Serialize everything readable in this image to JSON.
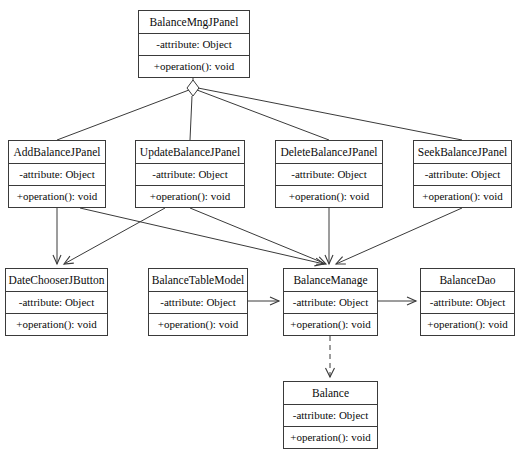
{
  "diagram": {
    "kind": "uml-class-diagram",
    "stroke_color": "#3a3a3a",
    "text_color": "#0b0b0b",
    "background_color": "#ffffff",
    "classes": [
      {
        "id": "balance-mng-jpanel",
        "name": "BalanceMngJPanel",
        "attribute": "-attribute: Object",
        "operation": "+operation(): void",
        "x": 138,
        "y": 10,
        "width": 112,
        "height": 68
      },
      {
        "id": "add-balance-jpanel",
        "name": "AddBalanceJPanel",
        "attribute": "-attribute: Object",
        "operation": "+operation(): void",
        "x": 8,
        "y": 140,
        "width": 98,
        "height": 68
      },
      {
        "id": "update-balance-jpanel",
        "name": "UpdateBalanceJPanel",
        "attribute": "-attribute: Object",
        "operation": "+operation(): void",
        "x": 135,
        "y": 140,
        "width": 110,
        "height": 68
      },
      {
        "id": "delete-balance-jpanel",
        "name": "DeleteBalanceJPanel",
        "attribute": "-attribute: Object",
        "operation": "+operation(): void",
        "x": 275,
        "y": 140,
        "width": 108,
        "height": 68
      },
      {
        "id": "seek-balance-jpanel",
        "name": "SeekBalanceJPanel",
        "attribute": "-attribute: Object",
        "operation": "+operation(): void",
        "x": 413,
        "y": 140,
        "width": 99,
        "height": 68
      },
      {
        "id": "date-chooser-jbutton",
        "name": "DateChooserJButton",
        "attribute": "-attribute: Object",
        "operation": "+operation(): void",
        "x": 5,
        "y": 268,
        "width": 103,
        "height": 68
      },
      {
        "id": "balance-table-model",
        "name": "BalanceTableModel",
        "attribute": "-attribute: Object",
        "operation": "+operation(): void",
        "x": 148,
        "y": 268,
        "width": 100,
        "height": 68
      },
      {
        "id": "balance-manage",
        "name": "BalanceManage",
        "attribute": "-attribute: Object",
        "operation": "+operation(): void",
        "x": 283,
        "y": 268,
        "width": 95,
        "height": 68
      },
      {
        "id": "balance-dao",
        "name": "BalanceDao",
        "attribute": "-attribute: Object",
        "operation": "+operation(): void",
        "x": 420,
        "y": 268,
        "width": 95,
        "height": 68
      },
      {
        "id": "balance",
        "name": "Balance",
        "attribute": "-attribute: Object",
        "operation": "+operation(): void",
        "x": 283,
        "y": 381,
        "width": 95,
        "height": 68
      }
    ],
    "relationships": [
      {
        "id": "rel-mng-add",
        "type": "aggregation",
        "from": "balance-mng-jpanel",
        "to": "add-balance-jpanel",
        "style": "solid"
      },
      {
        "id": "rel-mng-update",
        "type": "aggregation",
        "from": "balance-mng-jpanel",
        "to": "update-balance-jpanel",
        "style": "solid"
      },
      {
        "id": "rel-mng-delete",
        "type": "aggregation",
        "from": "balance-mng-jpanel",
        "to": "delete-balance-jpanel",
        "style": "solid"
      },
      {
        "id": "rel-mng-seek",
        "type": "aggregation",
        "from": "balance-mng-jpanel",
        "to": "seek-balance-jpanel",
        "style": "solid"
      },
      {
        "id": "rel-add-date",
        "type": "association",
        "from": "add-balance-jpanel",
        "to": "date-chooser-jbutton",
        "style": "solid"
      },
      {
        "id": "rel-update-date",
        "type": "association",
        "from": "update-balance-jpanel",
        "to": "date-chooser-jbutton",
        "style": "solid"
      },
      {
        "id": "rel-add-manage",
        "type": "association",
        "from": "add-balance-jpanel",
        "to": "balance-manage",
        "style": "solid"
      },
      {
        "id": "rel-update-manage",
        "type": "association",
        "from": "update-balance-jpanel",
        "to": "balance-manage",
        "style": "solid"
      },
      {
        "id": "rel-delete-manage",
        "type": "association",
        "from": "delete-balance-jpanel",
        "to": "balance-manage",
        "style": "solid"
      },
      {
        "id": "rel-seek-manage",
        "type": "association",
        "from": "seek-balance-jpanel",
        "to": "balance-manage",
        "style": "solid"
      },
      {
        "id": "rel-table-manage",
        "type": "association",
        "from": "balance-table-model",
        "to": "balance-manage",
        "style": "solid"
      },
      {
        "id": "rel-manage-dao",
        "type": "association",
        "from": "balance-manage",
        "to": "balance-dao",
        "style": "solid"
      },
      {
        "id": "rel-manage-balance",
        "type": "dependency",
        "from": "balance-manage",
        "to": "balance",
        "style": "dashed"
      }
    ]
  }
}
